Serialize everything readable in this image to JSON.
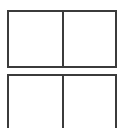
{
  "canvas": {
    "width": 125,
    "height": 128,
    "background_color": "#ffffff"
  },
  "style": {
    "border_color": "#3b3b3b",
    "fill_color": "#ffffff",
    "border_width_px": 2
  },
  "diagram": {
    "name": "two-panel-placeholder-boxes",
    "frames": [
      {
        "id": "top-frame",
        "label": "Top box",
        "clipped": false,
        "cells": [
          {
            "id": "top-left-cell",
            "label": "",
            "content": ""
          },
          {
            "id": "top-right-cell",
            "label": "",
            "content": ""
          }
        ]
      },
      {
        "id": "bottom-frame",
        "label": "Bottom box",
        "clipped": true,
        "cells": [
          {
            "id": "bottom-left-cell",
            "label": "",
            "content": ""
          },
          {
            "id": "bottom-right-cell",
            "label": "",
            "content": ""
          }
        ]
      }
    ]
  }
}
